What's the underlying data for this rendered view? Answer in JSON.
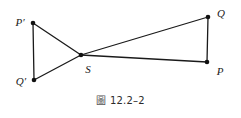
{
  "figure": {
    "caption_mark": "圖",
    "caption_number": "12.2–2",
    "caption_full": "圖 12.2–2",
    "stroke_color": "#1a1a1a",
    "background_color": "#ffffff",
    "vertex_dot_color": "#111111",
    "vertices": [
      {
        "id": "P-prime",
        "label": "P′",
        "x": 33,
        "y": 23,
        "label_x": 20,
        "label_y": 22
      },
      {
        "id": "Q-prime",
        "label": "Q′",
        "x": 34,
        "y": 80,
        "label_x": 21,
        "label_y": 81
      },
      {
        "id": "S",
        "label": "S",
        "x": 81,
        "y": 55,
        "label_x": 88,
        "label_y": 69
      },
      {
        "id": "Q",
        "label": "Q",
        "x": 208,
        "y": 17,
        "label_x": 221,
        "label_y": 13
      },
      {
        "id": "P",
        "label": "P",
        "x": 207,
        "y": 62,
        "label_x": 220,
        "label_y": 71
      }
    ],
    "segments": [
      {
        "id": "segment-Pprime-Qprime",
        "from": "P-prime",
        "to": "Q-prime"
      },
      {
        "id": "segment-Pprime-S",
        "from": "P-prime",
        "to": "S"
      },
      {
        "id": "segment-Qprime-S",
        "from": "Q-prime",
        "to": "S"
      },
      {
        "id": "segment-S-Q",
        "from": "S",
        "to": "Q"
      },
      {
        "id": "segment-S-P",
        "from": "S",
        "to": "P"
      },
      {
        "id": "segment-Q-P",
        "from": "Q",
        "to": "P"
      }
    ]
  }
}
